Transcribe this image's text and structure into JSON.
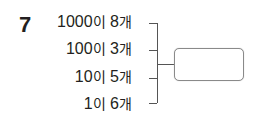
{
  "problem": {
    "number": "7",
    "rows": [
      {
        "value": "1000",
        "particle": "이",
        "count": "8",
        "unit": "개"
      },
      {
        "value": "100",
        "particle": "이",
        "count": "3",
        "unit": "개"
      },
      {
        "value": "10",
        "particle": "이",
        "count": "5",
        "unit": "개"
      },
      {
        "value": "1",
        "particle": "이",
        "count": "6",
        "unit": "개"
      }
    ],
    "answer_box": ""
  }
}
